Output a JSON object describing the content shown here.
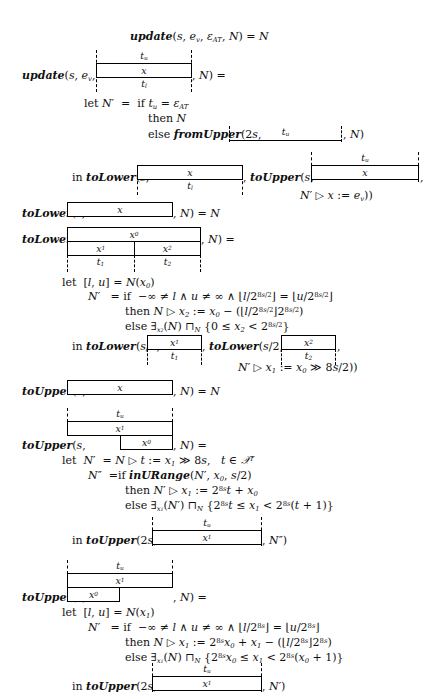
{
  "document": {
    "type": "formal-semantics-equations",
    "page_background": "#ffffff",
    "ink_color": "#101010"
  },
  "equations": [
    {
      "id": "update-base",
      "text": "update(s, e_v, ε_AT, N) = N",
      "parts": {
        "fn": "update",
        "args": "s, e_v, ε_AT, N",
        "rhs": "N"
      }
    },
    {
      "id": "update-rec",
      "lhs_prefix": "update(s, e_v,",
      "lhs_suffix": ", N) =",
      "diagram": {
        "top_label": "t_u",
        "cells": [
          "x"
        ],
        "bottom_label": "t_l"
      }
    },
    {
      "id": "update-let",
      "lines": [
        "let N' = if t_u = ε_AT",
        "then N",
        "else fromUpper(2s, [ t_u ], N)"
      ]
    },
    {
      "id": "update-in",
      "prefix": "in toLower(s,",
      "mid": ", toUpper(s,",
      "suffix": ",",
      "tail": "N' ▷ x := e_v))",
      "left_diagram": {
        "cells": [
          "x"
        ],
        "bottom_label": "t_l"
      },
      "right_diagram": {
        "top_label": "t_u",
        "cells": [
          "x"
        ]
      }
    },
    {
      "id": "tolower-base",
      "prefix": "toLower(s,",
      "suffix": ", N) = N",
      "diagram": {
        "cells": [
          "x"
        ]
      }
    },
    {
      "id": "tolower-rec",
      "prefix": "toLower(s,",
      "suffix": ", N) =",
      "diagram": {
        "top_cells": [
          "x_0"
        ],
        "bottom_cells": [
          "x_1",
          "x_2"
        ],
        "bottom_labels": [
          "t_1",
          "t_2"
        ]
      }
    },
    {
      "id": "tolower-let",
      "lines": [
        "let [l, u] = N(x_0)",
        "N' = if −∞ ≠ l ∧ u ≠ ∞ ∧ ⌊l/2^{8s/2}⌋ = ⌊u/2^{8s/2}⌋",
        "then N ▷ x_2 := x_0 − (⌊l/2^{8s/2}⌋2^{8s/2})",
        "else ∃_{x_2}(N) ⊓_N {0 ≤ x_2 < 2^{8s/2}}"
      ]
    },
    {
      "id": "tolower-in",
      "prefix": "in toLower(s/2,",
      "mid": ", toLower(s/2,",
      "suffix": ",",
      "tail": "N' ▷ x_1 := x_0 ≫ 8s/2))",
      "left_diagram": {
        "cells": [
          "x_1"
        ],
        "bottom_label": "t_1"
      },
      "right_diagram": {
        "cells": [
          "x_2"
        ],
        "bottom_label": "t_2"
      }
    },
    {
      "id": "toupper-base",
      "prefix": "toUpper(s,",
      "suffix": ", N) = N",
      "diagram": {
        "cells": [
          "x"
        ]
      }
    },
    {
      "id": "toupper-rec-1",
      "prefix": "toUpper(s,",
      "suffix": ", N) =",
      "diagram": {
        "top_label": "t_u",
        "upper_cells": [
          "x_1"
        ],
        "lower_cells": [
          "x_0"
        ],
        "lower_align": "right"
      }
    },
    {
      "id": "toupper-let-1",
      "lines": [
        "let N' = N ▷ t := x_1 ≫ 8s,   t ∈ 𝑳^T",
        "N'' = if inURange(N', x_0, s/2)",
        "then N' ▷ x_1 := 2^{8s}t + x_0",
        "else ∃_{x_1}(N') ⊓_N {2^{8s}t ≤ x_1 < 2^{8s}(t + 1)}"
      ]
    },
    {
      "id": "toupper-in-1",
      "prefix": "in toUpper(2s,",
      "suffix": ", N'')",
      "diagram": {
        "top_label": "t_u",
        "cells": [
          "x_1"
        ]
      }
    },
    {
      "id": "toupper-rec-2",
      "prefix": "toUpper(s,",
      "suffix": ", N) =",
      "diagram": {
        "top_label": "t_u",
        "upper_cells": [
          "x_1"
        ],
        "lower_cells": [
          "x_0"
        ],
        "lower_align": "left"
      }
    },
    {
      "id": "toupper-let-2",
      "lines": [
        "let [l, u] = N(x_1)",
        "N' = if −∞ ≠ l ∧ u ≠ ∞ ∧ ⌊l/2^{8s}⌋ = ⌊u/2^{8s}⌋",
        "then N ▷ x_1 := 2^{8s}x_0 + x_1 − (⌊l/2^{8s}⌋2^{8s})",
        "else ∃_{x_1}(N) ⊓_N {2^{8s}x_0 ≤ x_1 < 2^{8s}(x_0 + 1)}"
      ]
    },
    {
      "id": "toupper-in-2",
      "prefix": "in toUpper(2s,",
      "suffix": ", N')",
      "diagram": {
        "top_label": "t_u",
        "cells": [
          "x_1"
        ]
      }
    }
  ],
  "labels": {
    "t_u": "t",
    "t_u_sub": "u",
    "t_l": "t",
    "t_l_sub": "l",
    "t_1": "t",
    "t_1_sub": "1",
    "t_2": "t",
    "t_2_sub": "2",
    "x": "x",
    "x0": "x",
    "x0_sub": "0",
    "x1": "x",
    "x1_sub": "1",
    "x2": "x",
    "x2_sub": "2"
  },
  "text": {
    "update": "update",
    "toLower": "toLower",
    "toUpper": "toUpper",
    "fromUpper": "fromUpper",
    "inURange": "inURange",
    "let": "let",
    "in": "in",
    "if": "if",
    "then": "then",
    "else": "else",
    "N": "N",
    "Nprime": "N′",
    "Ndprime": "N″",
    "eq_update_base": "(s, e",
    "line_update_base_tail": ", N) = N",
    "eps_AT": "ε",
    "AT": "AT",
    "let_Np_if_tu": "= if t",
    "then_N": "then N",
    "else_fromUpper": "else",
    "two_s": "(2s,",
    "comma_N": ", N)",
    "in_toLower": "in",
    "comma": ",",
    "assign_ev": "▷ x := e",
    "close2": "))",
    "let_lu_N": "let [l, u] = N(",
    "close_paren": ")",
    "if_cond_1": "= if −∞ ≠ l ∧ u ≠ ∞ ∧ ⌊l/2",
    "if_cond_mid": "⌋ = ⌊u/2",
    "if_cond_end": "⌋",
    "exp_8s_2": "8s/2",
    "exp_8s": "8s",
    "then_assign_x2": "then N ▷ x",
    "then_assign_x2_b": ":= x",
    "then_assign_x2_c": "− (⌊l/2",
    "then_assign_x2_d": "⌋2",
    "then_assign_x2_e": ")",
    "else_exists": "else ∃",
    "sqcap_N": "⊓",
    "set_0_le": "{0 ≤ x",
    "lt_2": "< 2",
    "rbrace": "}",
    "shift_assign": "▷ x",
    "shift_assign_b": ":= x",
    "shift_assign_c": "≫ 8s/2))",
    "toupper_let_t": "= N ▷ t := x",
    "toupper_let_t_b": "≫ 8s,",
    "t_in_XT": "t ∈",
    "X": "𝒟",
    "T": "T",
    "Ndp_if": "=if",
    "inURange_args": "(N′, x",
    "inURange_args_b": ", s/2)",
    "then_Np_x1": "then N′ ▷ x",
    "then_Np_x1_b": ":= 2",
    "then_Np_x1_c": "t + x",
    "else_exists_x1": "else ∃",
    "set_2_8s_t": "{2",
    "t_le_x1": "t ≤ x",
    "lt_2_8s": "< 2",
    "t_plus_1": "(t + 1)}",
    "then_N_x1": "then N ▷ x",
    "then_N_x1_b": ":= 2",
    "then_N_x1_c": "x",
    "then_N_x1_d": "+ x",
    "then_N_x1_e": "− (⌊l/2",
    "then_N_x1_f": "⌋2",
    "set_2_8s_x0": "{2",
    "x0_le_x1": "x",
    "le_x1": "≤ x",
    "x0_plus_1": "(x",
    "x0_plus_1_b": "+ 1)}"
  }
}
